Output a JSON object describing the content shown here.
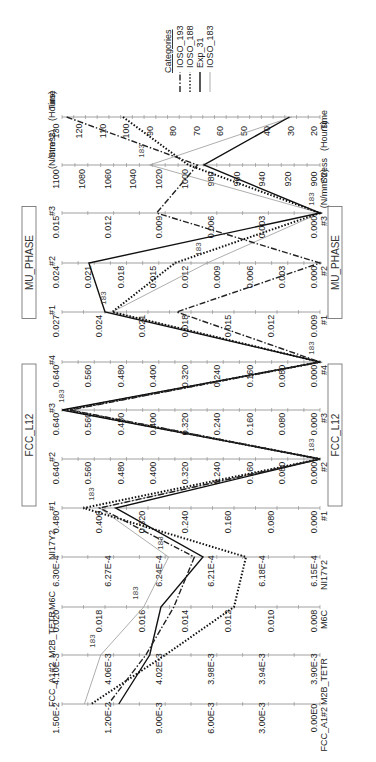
{
  "chart_data": {
    "type": "parallel_coordinates",
    "orientation": "rotated_90_clockwise",
    "legend": {
      "title": "Categories",
      "entries": [
        {
          "name": "IOSO_193",
          "style": "dash-dot",
          "color": "#222222",
          "width": 1.4
        },
        {
          "name": "IOSO_188",
          "style": "dotted",
          "color": "#111111",
          "width": 2.0
        },
        {
          "name": "Exp_31",
          "style": "solid",
          "color": "#111111",
          "width": 1.4
        },
        {
          "name": "IOSO_183",
          "style": "solid",
          "color": "#999999",
          "width": 0.8
        }
      ]
    },
    "groups": [
      {
        "label": "MU_PHASE",
        "axes": [
          "MU_PHASE #1",
          "MU_PHASE #2",
          "MU_PHASE #3"
        ]
      },
      {
        "label": "FCC_L12",
        "axes": [
          "FCC_L12 #1",
          "FCC_L12 #2",
          "FCC_L12 #3",
          "FCC_L12 #4"
        ]
      }
    ],
    "axes": [
      {
        "key": "time",
        "name": "Time (Hours)",
        "name_lines": [
          "Time",
          "(Hours)"
        ],
        "min": 20,
        "max": 130,
        "ticks": [
          "130",
          "120",
          "110",
          "100",
          "90",
          "80",
          "70",
          "60",
          "50",
          "40",
          "30",
          "20"
        ]
      },
      {
        "key": "stress",
        "name": "Stress (N/mm^2)",
        "name_lines": [
          "Stress",
          "(N/mm^2)"
        ],
        "min": 900,
        "max": 1100,
        "ticks": [
          "1100",
          "1080",
          "1060",
          "1040",
          "1020",
          "1000",
          "980",
          "960",
          "940",
          "920",
          "900"
        ]
      },
      {
        "key": "mu3",
        "name": "#3",
        "min": 0.0,
        "max": 0.015,
        "ticks": [
          "0.015",
          "0.012",
          "0.009",
          "0.006",
          "0.003",
          "0.000"
        ]
      },
      {
        "key": "mu2",
        "name": "#2",
        "min": 0.0,
        "max": 0.024,
        "ticks": [
          "0.024",
          "0.021",
          "0.018",
          "0.015",
          "0.012",
          "0.009",
          "0.006",
          "0.003",
          "0.000"
        ]
      },
      {
        "key": "mu1",
        "name": "#1",
        "min": 0.009,
        "max": 0.027,
        "ticks": [
          "0.027",
          "0.024",
          "0.021",
          "0.018",
          "0.015",
          "0.012",
          "0.009"
        ]
      },
      {
        "key": "fcc4",
        "name": "#4",
        "min": 0.0,
        "max": 0.64,
        "ticks": [
          "0.640",
          "0.560",
          "0.480",
          "0.400",
          "0.320",
          "0.240",
          "0.160",
          "0.080",
          "0.000"
        ]
      },
      {
        "key": "fcc3",
        "name": "#3",
        "min": 0.0,
        "max": 0.64,
        "ticks": [
          "0.640",
          "0.560",
          "0.480",
          "0.400",
          "0.320",
          "0.240",
          "0.160",
          "0.080",
          "0.000"
        ]
      },
      {
        "key": "fcc2",
        "name": "#2",
        "min": 0.0,
        "max": 0.64,
        "ticks": [
          "0.640",
          "0.560",
          "0.480",
          "0.400",
          "0.320",
          "0.240",
          "0.160",
          "0.080",
          "0.000"
        ]
      },
      {
        "key": "fcc1",
        "name": "#1",
        "min": 0.0,
        "max": 0.48,
        "ticks": [
          "0.480",
          "0.400",
          "0.320",
          "0.240",
          "0.160",
          "0.080",
          "0.000"
        ]
      },
      {
        "key": "ni17y2",
        "name": "NI17Y2",
        "min": 0.000615,
        "max": 0.00063,
        "ticks": [
          "6.30E-4",
          "6.27E-4",
          "6.24E-4",
          "6.21E-4",
          "6.18E-4",
          "6.15E-4"
        ]
      },
      {
        "key": "m6c",
        "name": "M6C",
        "min": 0.008,
        "max": 0.02,
        "ticks": [
          "0.020",
          "0.018",
          "0.016",
          "0.014",
          "0.012",
          "0.010",
          "0.008"
        ]
      },
      {
        "key": "m2b",
        "name": "M2B_TETR",
        "min": 0.0039,
        "max": 0.0041,
        "ticks": [
          "4.10E-3",
          "4.06E-3",
          "4.02E-3",
          "3.98E-3",
          "3.94E-3",
          "3.90E-3"
        ]
      },
      {
        "key": "fcca1",
        "name": "FCC_A1#2",
        "min": 0.0,
        "max": 0.015,
        "ticks": [
          "1.50E-2",
          "1.20E-2",
          "9.00E-3",
          "6.00E-3",
          "3.00E-3",
          "0.00E0"
        ]
      }
    ],
    "series": [
      {
        "name": "IOSO_193",
        "values": {
          "time": 128,
          "stress": 995,
          "mu3": 0.0095,
          "mu2": 0.0,
          "mu1": 0.019,
          "fcc4": 0.0,
          "fcc3": 0.62,
          "fcc2": 0.0,
          "fcc1": 0.41,
          "ni17y2": 0.0006223,
          "m6c": 0.0148,
          "m2b": 0.004035,
          "fcca1": 0.0123
        }
      },
      {
        "name": "IOSO_188",
        "values": {
          "time": 104,
          "stress": 1002,
          "mu3": 0.0,
          "mu2": 0.0135,
          "mu1": 0.0235,
          "fcc4": 0.0,
          "fcc3": 0.63,
          "fcc2": 0.0,
          "fcc1": 0.44,
          "ni17y2": 0.0006193,
          "m6c": 0.012,
          "m2b": 0.00402,
          "fcca1": 0.0133
        }
      },
      {
        "name": "Exp_31",
        "values": {
          "time": 33,
          "stress": 990,
          "mu3": 0.0,
          "mu2": 0.0215,
          "mu1": 0.024,
          "fcc4": 0.0,
          "fcc3": 0.64,
          "fcc2": 0.0,
          "fcc1": 0.38,
          "ni17y2": 0.0006218,
          "m6c": 0.0154,
          "m2b": 0.004032,
          "fcca1": 0.0117
        }
      },
      {
        "name": "IOSO_183",
        "values": {
          "time": 32,
          "stress": 1032,
          "mu3": 0.0,
          "mu2": 0.0105,
          "mu1": 0.0235,
          "fcc4": 0.0,
          "fcc3": 0.62,
          "fcc2": 0.0,
          "fcc1": 0.41,
          "ni17y2": 0.0006238,
          "m6c": 0.0162,
          "m2b": 0.00407,
          "fcca1": 0.0137
        }
      }
    ],
    "annotations": [
      {
        "text": "183",
        "axis": "stress"
      },
      {
        "text": "183",
        "axis": "mu3"
      },
      {
        "text": "183",
        "axis": "mu2"
      },
      {
        "text": "183",
        "axis": "mu1"
      },
      {
        "text": "183",
        "axis": "fcc4"
      },
      {
        "text": "183",
        "axis": "fcc3"
      },
      {
        "text": "183",
        "axis": "fcc2"
      },
      {
        "text": "183",
        "axis": "fcc1"
      },
      {
        "text": "183",
        "axis": "ni17y2"
      },
      {
        "text": "183",
        "axis": "m6c"
      },
      {
        "text": "183",
        "axis": "m2b"
      }
    ],
    "title": "",
    "xlabel": "",
    "ylabel": ""
  }
}
